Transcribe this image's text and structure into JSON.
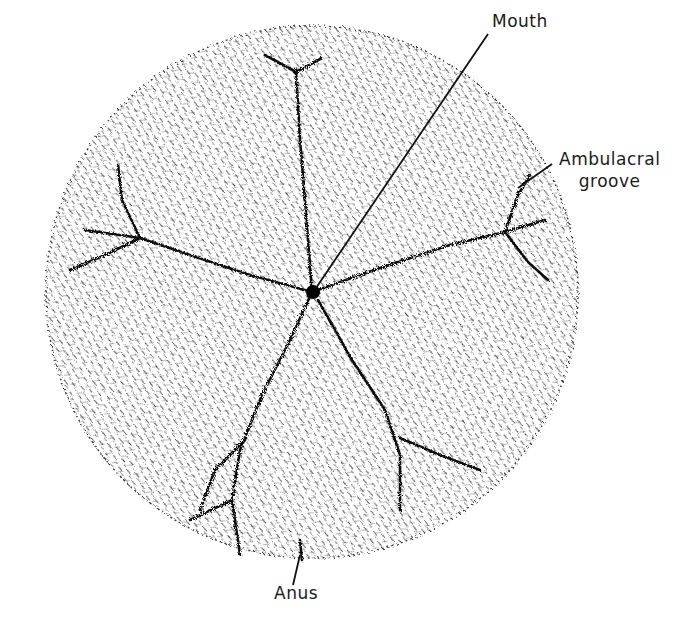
{
  "figure": {
    "background_color": "#ffffff",
    "ink_color": "#1a1a1a"
  },
  "labels": {
    "mouth": "Mouth",
    "ambulacral_line1": "Ambulacral",
    "ambulacral_line2": "groove",
    "anus": "Anus"
  }
}
